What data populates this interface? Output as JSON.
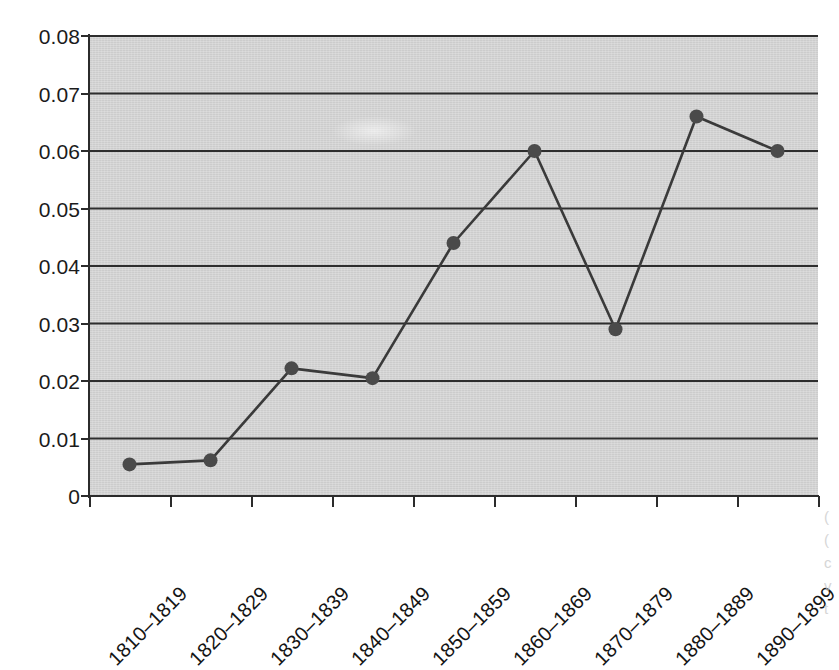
{
  "chart_data": {
    "type": "line",
    "title": "",
    "subtitle": "",
    "xlabel": "",
    "ylabel": "",
    "categories": [
      "1810–1819",
      "1820–1829",
      "1830–1839",
      "1840–1849",
      "1850–1859",
      "1860–1869",
      "1870–1879",
      "1880–1889",
      "1890–1899"
    ],
    "values": [
      0.0055,
      0.0062,
      0.0222,
      0.0205,
      0.044,
      0.06,
      0.029,
      0.066,
      0.06
    ],
    "ylim": [
      0,
      0.08
    ],
    "ytick_values": [
      0,
      0.01,
      0.02,
      0.03,
      0.04,
      0.05,
      0.06,
      0.07,
      0.08
    ],
    "ytick_labels": [
      "0",
      "0.01",
      "0.02",
      "0.03",
      "0.04",
      "0.05",
      "0.06",
      "0.07",
      "0.08"
    ],
    "grid": "horizontal",
    "legend": "none",
    "marker": "circle",
    "series_name": "",
    "xtick_rotation_deg": -45,
    "annotations": []
  },
  "style": {
    "plot_background": "#d2d2d2",
    "line_color": "#3a3a3a",
    "marker_color": "#4a4a4a",
    "gridline_color": "#2e2e2e",
    "axis_color": "#2b2b2b",
    "tick_label_color": "#1b1b1b",
    "page_background": "#ffffff"
  },
  "page_bleed": {
    "lines": [
      "(",
      "(",
      "c",
      "v",
      "t"
    ]
  }
}
